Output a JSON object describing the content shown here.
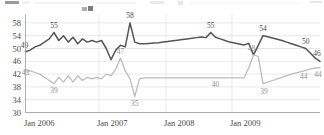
{
  "chart_data": {
    "type": "line",
    "title": "",
    "xlabel": "",
    "ylabel": "",
    "ylim": [
      30,
      60
    ],
    "grid": true,
    "legend": "none",
    "y_ticks": [
      58,
      54,
      50,
      46,
      42,
      38,
      34,
      30
    ],
    "x_ticks": [
      "Jan 2006",
      "Jan 2007",
      "Jan 2008",
      "Jan 2009"
    ],
    "colors": {
      "series_upper": "#555555",
      "series_lower": "#bcbcbc",
      "grid": "#d8d8d8",
      "axis": "#9a9a9a",
      "label_dark": "#4c4c4c",
      "label_light": "#8f8f8f",
      "background": "#ffffff"
    },
    "series": [
      {
        "name": "upper",
        "color": "#555555",
        "values": [
          49,
          49.5,
          50.5,
          51,
          52,
          53,
          55,
          52.5,
          54,
          52,
          53.5,
          51.5,
          53,
          52,
          52.5,
          52,
          52.5,
          50,
          46.5,
          49.5,
          51,
          50.5,
          58,
          52,
          51.5,
          51.5,
          51.6,
          51.7,
          51.8,
          52,
          52.2,
          52.4,
          52.6,
          52.8,
          53,
          53.2,
          53.4,
          53.6,
          53.4,
          55,
          53.5,
          53,
          52.5,
          52,
          51.7,
          51.4,
          51.1,
          51.6,
          48,
          51,
          54,
          53.7,
          53.3,
          52.9,
          52.5,
          52,
          51.5,
          51,
          50.5,
          50,
          48.5,
          47,
          46
        ]
      },
      {
        "name": "lower",
        "color": "#bcbcbc",
        "values": [
          43,
          43,
          42.5,
          42,
          41,
          40,
          39,
          41,
          39.5,
          41.5,
          39.5,
          41.5,
          40,
          41,
          40.5,
          41,
          40.5,
          42,
          41.5,
          43.5,
          47,
          43,
          40.5,
          35,
          40.5,
          40.8,
          40.8,
          40.8,
          40.8,
          40.8,
          40.8,
          40.8,
          40.8,
          40.8,
          40.8,
          40.8,
          40.8,
          40.8,
          40.8,
          40.8,
          40.8,
          40.8,
          40.8,
          40.8,
          40.8,
          40.8,
          40.8,
          44,
          48,
          47.5,
          39,
          39.5,
          40,
          40.5,
          41,
          41.5,
          42,
          42.4,
          42.8,
          43.2,
          43.6,
          43.9,
          44
        ]
      }
    ],
    "point_labels": [
      {
        "series": "upper",
        "value": "49",
        "index": 0,
        "dx": -1,
        "dy": -4
      },
      {
        "series": "upper",
        "value": "55",
        "index": 6,
        "dx": 0,
        "dy": -5
      },
      {
        "series": "upper",
        "value": "58",
        "index": 22,
        "dx": 0,
        "dy": -5
      },
      {
        "series": "upper",
        "value": "55",
        "index": 39,
        "dx": 0,
        "dy": -5
      },
      {
        "series": "upper",
        "value": "54",
        "index": 50,
        "dx": 0,
        "dy": -5
      },
      {
        "series": "upper",
        "value": "50",
        "index": 59,
        "dx": 0,
        "dy": -5
      },
      {
        "series": "upper",
        "value": "46",
        "index": 62,
        "dx": -3,
        "dy": -5
      },
      {
        "series": "lower",
        "value": "43",
        "index": 0,
        "dx": 0,
        "dy": 4
      },
      {
        "series": "lower",
        "value": "39",
        "index": 6,
        "dx": 0,
        "dy": 9
      },
      {
        "series": "lower",
        "value": "47",
        "index": 20,
        "dx": 0,
        "dy": -4
      },
      {
        "series": "lower",
        "value": "35",
        "index": 23,
        "dx": 0,
        "dy": 9
      },
      {
        "series": "lower",
        "value": "40",
        "index": 40,
        "dx": 0,
        "dy": 9
      },
      {
        "series": "lower",
        "value": "48",
        "index": 48,
        "dx": -2,
        "dy": -4
      },
      {
        "series": "lower",
        "value": "39",
        "index": 50,
        "dx": 1,
        "dy": 10
      },
      {
        "series": "lower",
        "value": "44",
        "index": 59,
        "dx": -2,
        "dy": 9
      },
      {
        "series": "lower",
        "value": "44",
        "index": 62,
        "dx": -2,
        "dy": 9
      }
    ]
  }
}
